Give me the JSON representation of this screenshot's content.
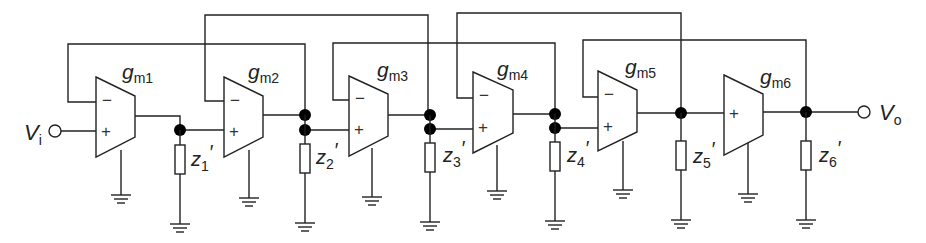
{
  "input": {
    "label": "V",
    "sub": "i"
  },
  "output": {
    "label": "V",
    "sub": "o"
  },
  "amplifiers": [
    {
      "name": "g",
      "sub": "m1",
      "has_minus": true
    },
    {
      "name": "g",
      "sub": "m2",
      "has_minus": true
    },
    {
      "name": "g",
      "sub": "m3",
      "has_minus": true
    },
    {
      "name": "g",
      "sub": "m4",
      "has_minus": true
    },
    {
      "name": "g",
      "sub": "m5",
      "has_minus": true
    },
    {
      "name": "g",
      "sub": "m6",
      "has_minus": false
    }
  ],
  "impedances": [
    {
      "name": "z",
      "sub": "1",
      "prime": "′"
    },
    {
      "name": "z",
      "sub": "2",
      "prime": "′"
    },
    {
      "name": "z",
      "sub": "3",
      "prime": "′"
    },
    {
      "name": "z",
      "sub": "4",
      "prime": "′"
    },
    {
      "name": "z",
      "sub": "5",
      "prime": "′"
    },
    {
      "name": "z",
      "sub": "6",
      "prime": "′"
    }
  ],
  "signs": {
    "minus": "−",
    "plus": "+"
  },
  "feedback_loops": [
    {
      "from_amp": "gm1 (−)",
      "to_node": 2
    },
    {
      "from_amp": "gm2 (−)",
      "to_node": 3
    },
    {
      "from_amp": "gm3 (−)",
      "to_node": 4
    },
    {
      "from_amp": "gm4 (−)",
      "to_node": 5
    },
    {
      "from_amp": "gm5 (−)",
      "to_node": 6
    }
  ]
}
